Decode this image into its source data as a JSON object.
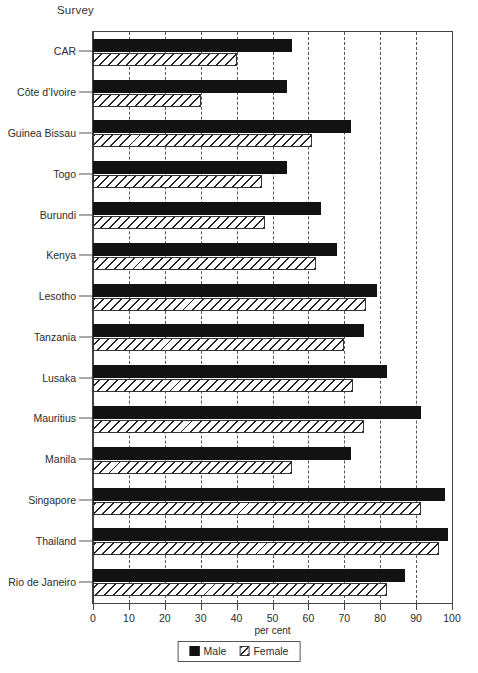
{
  "header": {
    "survey_label": "Survey"
  },
  "axis": {
    "x_title": "per cent",
    "x_ticks": [
      "0",
      "10",
      "20",
      "30",
      "40",
      "50",
      "60",
      "70",
      "80",
      "90",
      "100"
    ]
  },
  "legend": {
    "position": "bottom-center",
    "items": [
      {
        "label": "Male",
        "swatch": "solid-black-square-icon"
      },
      {
        "label": "Female",
        "swatch": "hatched-square-icon"
      }
    ]
  },
  "colors": {
    "male": "#121212",
    "female_hatch": "#222222",
    "axis": "#444444",
    "text": "#2b2b2b"
  },
  "chart_data": {
    "type": "bar",
    "orientation": "horizontal",
    "title": "",
    "subtitle": "",
    "xlabel": "per cent",
    "ylabel": "Survey",
    "xlim": [
      0,
      100
    ],
    "grid": true,
    "grid_axis": "x",
    "legend_position": "bottom-center",
    "categories": [
      "CAR",
      "Côte d’Ivoire",
      "Guinea Bissau",
      "Togo",
      "Burundi",
      "Kenya",
      "Lesotho",
      "Tanzania",
      "Lusaka",
      "Mauritius",
      "Manila",
      "Singapore",
      "Thailand",
      "Rio de Janeiro"
    ],
    "series": [
      {
        "name": "Male",
        "values": [
          55.5,
          54,
          72,
          54,
          63.5,
          68,
          79,
          75.5,
          82,
          91.5,
          72,
          98,
          99,
          87
        ]
      },
      {
        "name": "Female",
        "values": [
          40,
          30,
          61,
          47,
          48,
          62,
          76,
          70,
          72.5,
          75.5,
          55.5,
          91.5,
          96.5,
          82
        ]
      }
    ]
  }
}
